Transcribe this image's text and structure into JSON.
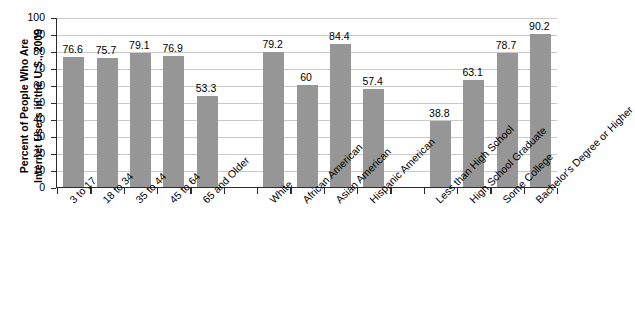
{
  "chart_data": {
    "type": "bar",
    "title": "",
    "xlabel": "",
    "ylabel": "Percent of People Who Are Internet Users in the U.S., 2009",
    "ylabel_line1": "Percent of People Who Are",
    "ylabel_line2": "Internet Users in the U.S., 2009",
    "ylim": [
      0,
      100
    ],
    "ytick_values": [
      0,
      10,
      20,
      30,
      40,
      50,
      60,
      70,
      80,
      90,
      100
    ],
    "ytick_labels": [
      "0",
      "10",
      "20",
      "30",
      "40",
      "50",
      "60",
      "70",
      "80",
      "90",
      "100"
    ],
    "grid": true,
    "legend": "none",
    "bar_color": "#969696",
    "axis_color": "#2b2b2b",
    "grid_color": "#c9c9c9",
    "categories": [
      "3 to 17",
      "18 to 34",
      "35 to 44",
      "45 to 64",
      "65 and Older",
      "White",
      "African American",
      "Asian American",
      "Hispanic American",
      "Less than High School",
      "High School Graduate",
      "Some College",
      "Bachelor's Degree or Higher"
    ],
    "values": [
      76.6,
      75.7,
      79.1,
      76.9,
      53.3,
      79.2,
      60,
      84.4,
      57.4,
      38.8,
      63.1,
      78.7,
      90.2
    ],
    "value_labels": [
      "76.6",
      "75.7",
      "79.1",
      "76.9",
      "53.3",
      "79.2",
      "60",
      "84.4",
      "57.4",
      "38.8",
      "63.1",
      "78.7",
      "90.2"
    ],
    "slots": [
      0,
      1,
      2,
      3,
      4,
      6,
      7,
      8,
      9,
      11,
      12,
      13,
      14
    ],
    "slot_count": 15,
    "groups": [
      {
        "name": "Age",
        "categories": [
          "3 to 17",
          "18 to 34",
          "35 to 44",
          "45 to 64",
          "65 and Older"
        ]
      },
      {
        "name": "Race/Ethnicity",
        "categories": [
          "White",
          "African American",
          "Asian American",
          "Hispanic American"
        ]
      },
      {
        "name": "Education",
        "categories": [
          "Less than High School",
          "High School Graduate",
          "Some College",
          "Bachelor's Degree or Higher"
        ]
      }
    ]
  }
}
